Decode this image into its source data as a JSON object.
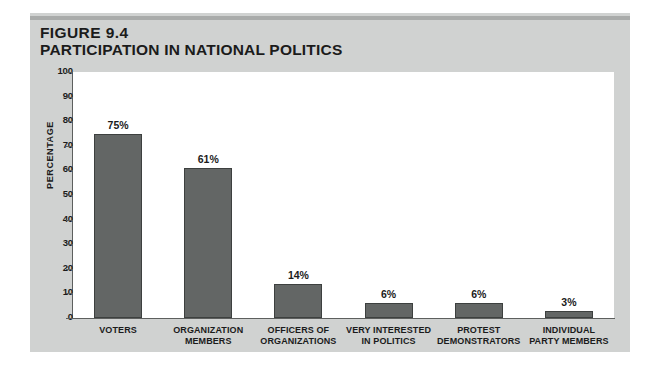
{
  "figure": {
    "number": "FIGURE 9.4",
    "title": "PARTICIPATION IN NATIONAL POLITICS"
  },
  "chart_data": {
    "type": "bar",
    "title": "PARTICIPATION IN NATIONAL POLITICS",
    "xlabel": "",
    "ylabel": "PERCENTAGE",
    "ylim": [
      0,
      100
    ],
    "yticks": [
      0,
      10,
      20,
      30,
      40,
      50,
      60,
      70,
      80,
      90,
      100
    ],
    "grid": false,
    "legend": null,
    "categories": [
      "VOTERS",
      "ORGANIZATION MEMBERS",
      "OFFICERS OF ORGANIZATIONS",
      "VERY INTERESTED IN POLITICS",
      "PROTEST DEMONSTRATORS",
      "INDIVIDUAL PARTY MEMBERS"
    ],
    "category_lines": [
      [
        "VOTERS"
      ],
      [
        "ORGANIZATION",
        "MEMBERS"
      ],
      [
        "OFFICERS OF",
        "ORGANIZATIONS"
      ],
      [
        "VERY INTERESTED",
        "IN POLITICS"
      ],
      [
        "PROTEST",
        "DEMONSTRATORS"
      ],
      [
        "INDIVIDUAL",
        "PARTY MEMBERS"
      ]
    ],
    "values": [
      75,
      61,
      14,
      6,
      6,
      3
    ],
    "value_labels": [
      "75%",
      "61%",
      "14%",
      "6%",
      "6%",
      "3%"
    ],
    "bar_color": "#636665",
    "bar_edge_color": "#3d403f",
    "plot_background": "#ffffff",
    "panel_background": "#d0d2d1"
  }
}
